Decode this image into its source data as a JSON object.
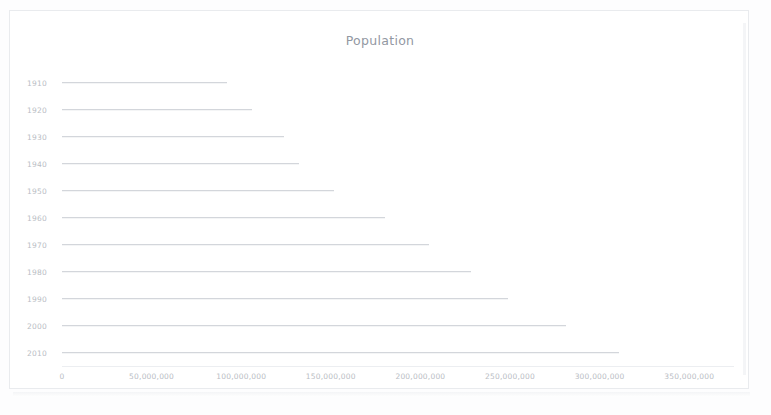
{
  "chart_data": {
    "type": "bar",
    "orientation": "horizontal",
    "title": "Population",
    "xlabel": "",
    "ylabel": "",
    "xlim": [
      0,
      375000000
    ],
    "grid": false,
    "legend": null,
    "categories": [
      "1910",
      "1920",
      "1930",
      "1940",
      "1950",
      "1960",
      "1970",
      "1980",
      "1990",
      "2000",
      "2010"
    ],
    "values": [
      92000000,
      106000000,
      124000000,
      132000000,
      152000000,
      180000000,
      205000000,
      228000000,
      249000000,
      281000000,
      311000000
    ],
    "xtick_labels": [
      "0",
      "50,000,000",
      "100,000,000",
      "150,000,000",
      "200,000,000",
      "250,000,000",
      "300,000,000",
      "350,000,000"
    ],
    "xtick_values": [
      0,
      50000000,
      100000000,
      150000000,
      200000000,
      250000000,
      300000000,
      350000000
    ],
    "bar_color": "#c9ccd2",
    "axis_text_color": "#b9bdc4",
    "title_color": "#9298a2"
  },
  "card": {
    "border_color": "#e9ebee",
    "background": "#ffffff"
  }
}
